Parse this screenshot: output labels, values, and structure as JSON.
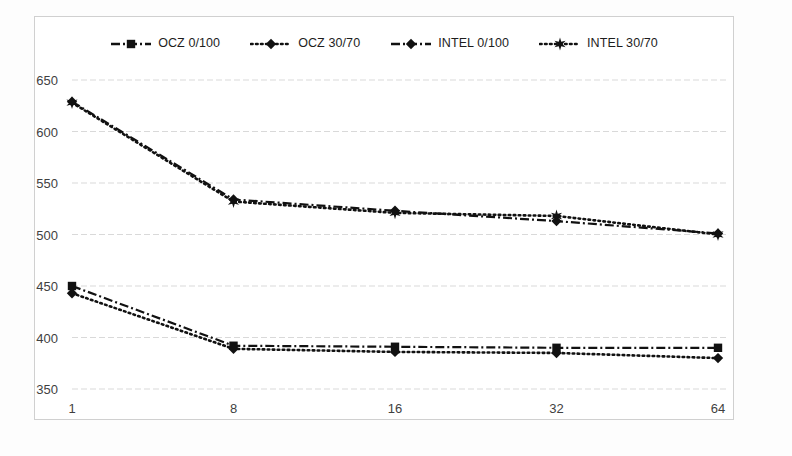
{
  "chart_data": {
    "type": "line",
    "title": "",
    "subtitle": "",
    "xlabel": "",
    "ylabel": "",
    "categories": [
      "1",
      "8",
      "16",
      "32",
      "64"
    ],
    "x_tick_labels": [
      "1",
      "8",
      "16",
      "32",
      "64"
    ],
    "y_tick_labels": [
      "350",
      "400",
      "450",
      "500",
      "550",
      "600",
      "650"
    ],
    "y_ticks": [
      350,
      400,
      450,
      500,
      550,
      600,
      650
    ],
    "ylim": [
      350,
      650
    ],
    "grid": "horizontal",
    "legend_position": "top-center",
    "series": [
      {
        "name": "OCZ 0/100",
        "marker": "square",
        "line_style": "dash-dot",
        "color": "#111111",
        "values": [
          450,
          392,
          391,
          390,
          390
        ]
      },
      {
        "name": "OCZ 30/70",
        "marker": "diamond",
        "line_style": "dotted",
        "color": "#111111",
        "values": [
          443,
          389,
          386,
          385,
          380
        ]
      },
      {
        "name": "INTEL 0/100",
        "marker": "diamond",
        "line_style": "dash-dot",
        "color": "#111111",
        "values": [
          629,
          534,
          523,
          513,
          501
        ]
      },
      {
        "name": "INTEL 30/70",
        "marker": "star",
        "line_style": "dotted",
        "color": "#111111",
        "values": [
          628,
          532,
          521,
          518,
          500
        ]
      }
    ]
  },
  "legend": {
    "items": [
      {
        "label": "OCZ 0/100",
        "marker": "square",
        "line_style": "dash-dot"
      },
      {
        "label": "OCZ 30/70",
        "marker": "diamond",
        "line_style": "dotted"
      },
      {
        "label": "INTEL 0/100",
        "marker": "diamond",
        "line_style": "dash-dot"
      },
      {
        "label": "INTEL 30/70",
        "marker": "star",
        "line_style": "dotted"
      }
    ]
  },
  "style": {
    "plot_background": "#ffffff",
    "frame_border": "#d0d0d0",
    "gridline_color": "#d9d9d9",
    "tick_text_color": "#3f3f3f",
    "series_color": "#111111"
  }
}
